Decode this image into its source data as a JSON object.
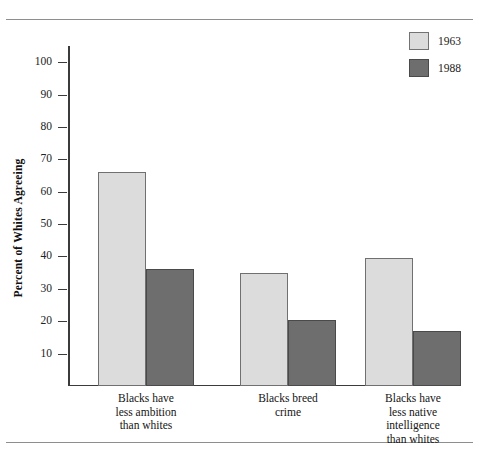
{
  "chart_data": {
    "type": "bar",
    "title": "",
    "xlabel": "",
    "ylabel": "Percent of Whites Agreeing",
    "ylim": [
      0,
      105
    ],
    "ytick_step": 10,
    "yticks": [
      10,
      20,
      30,
      40,
      50,
      60,
      70,
      80,
      90,
      100
    ],
    "ytick_labels": [
      "10",
      "20",
      "30",
      "40",
      "50",
      "60",
      "70",
      "80",
      "90",
      "100"
    ],
    "grid": false,
    "legend_position": "top-right",
    "categories": [
      "Blacks have less ambition than whites",
      "Blacks breed crime",
      "Blacks have less native intelligence than whites"
    ],
    "category_lines": [
      [
        "Blacks have",
        "less ambition",
        "than whites"
      ],
      [
        "Blacks breed",
        "crime"
      ],
      [
        "Blacks have",
        "less native",
        "intelligence",
        "than whites"
      ]
    ],
    "series": [
      {
        "name": "1963",
        "color": "#dcdcdc",
        "values": [
          66,
          35,
          39.5
        ]
      },
      {
        "name": "1988",
        "color": "#6e6e6e",
        "values": [
          36,
          20.5,
          17
        ]
      }
    ]
  },
  "legend": {
    "items": [
      {
        "label": "1963",
        "color": "#dcdcdc"
      },
      {
        "label": "1988",
        "color": "#6e6e6e"
      }
    ]
  }
}
